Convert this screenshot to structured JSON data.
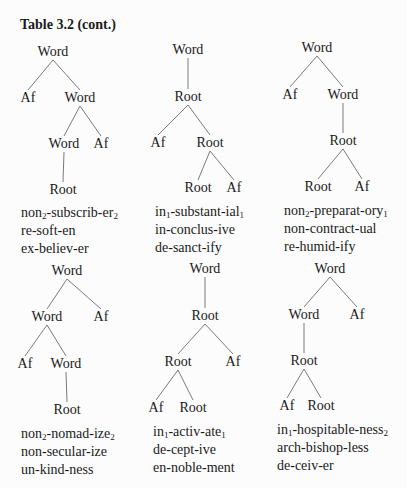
{
  "title": "Table 3.2 (cont.)",
  "trees": [
    {
      "nodes": [
        {
          "label": "Word",
          "x": 53,
          "y": 52
        },
        {
          "label": "Af",
          "x": 28,
          "y": 98
        },
        {
          "label": "Word",
          "x": 80,
          "y": 98
        },
        {
          "label": "Word",
          "x": 64,
          "y": 144
        },
        {
          "label": "Af",
          "x": 101,
          "y": 144
        },
        {
          "label": "Root",
          "x": 63,
          "y": 190
        }
      ],
      "edges": [
        [
          0,
          1
        ],
        [
          0,
          2
        ],
        [
          2,
          3
        ],
        [
          2,
          4
        ],
        [
          3,
          5
        ]
      ],
      "examples_pos": {
        "x": 21,
        "y": 204
      },
      "examples": [
        {
          "base": "non",
          "sub1": "2",
          "mid": "-subscrib-er",
          "sub2": "2"
        },
        {
          "base": "re-soft-en",
          "sub1": "",
          "mid": "",
          "sub2": ""
        },
        {
          "base": "ex-believ-er",
          "sub1": "",
          "mid": "",
          "sub2": ""
        }
      ]
    },
    {
      "nodes": [
        {
          "label": "Word",
          "x": 188,
          "y": 50
        },
        {
          "label": "Root",
          "x": 188,
          "y": 97
        },
        {
          "label": "Af",
          "x": 158,
          "y": 143
        },
        {
          "label": "Root",
          "x": 210,
          "y": 143
        },
        {
          "label": "Root",
          "x": 198,
          "y": 188
        },
        {
          "label": "Af",
          "x": 234,
          "y": 188
        }
      ],
      "edges": [
        [
          0,
          1
        ],
        [
          1,
          2
        ],
        [
          1,
          3
        ],
        [
          3,
          4
        ],
        [
          3,
          5
        ]
      ],
      "examples_pos": {
        "x": 155,
        "y": 203
      },
      "examples": [
        {
          "base": "in",
          "sub1": "1",
          "mid": "-substant-ial",
          "sub2": "1"
        },
        {
          "base": "in-conclus-ive",
          "sub1": "",
          "mid": "",
          "sub2": ""
        },
        {
          "base": "de-sanct-ify",
          "sub1": "",
          "mid": "",
          "sub2": ""
        }
      ]
    },
    {
      "nodes": [
        {
          "label": "Word",
          "x": 317,
          "y": 48
        },
        {
          "label": "Af",
          "x": 290,
          "y": 95
        },
        {
          "label": "Word",
          "x": 343,
          "y": 95
        },
        {
          "label": "Root",
          "x": 343,
          "y": 141
        },
        {
          "label": "Root",
          "x": 318,
          "y": 187
        },
        {
          "label": "Af",
          "x": 362,
          "y": 187
        }
      ],
      "edges": [
        [
          0,
          1
        ],
        [
          0,
          2
        ],
        [
          2,
          3
        ],
        [
          3,
          4
        ],
        [
          3,
          5
        ]
      ],
      "examples_pos": {
        "x": 284,
        "y": 202
      },
      "examples": [
        {
          "base": "non",
          "sub1": "2",
          "mid": "-preparat-ory",
          "sub2": "1"
        },
        {
          "base": "non-contract-ual",
          "sub1": "",
          "mid": "",
          "sub2": ""
        },
        {
          "base": "re-humid-ify",
          "sub1": "",
          "mid": "",
          "sub2": ""
        }
      ]
    },
    {
      "nodes": [
        {
          "label": "Word",
          "x": 67,
          "y": 271
        },
        {
          "label": "Word",
          "x": 47,
          "y": 317
        },
        {
          "label": "Af",
          "x": 101,
          "y": 317
        },
        {
          "label": "Af",
          "x": 25,
          "y": 364
        },
        {
          "label": "Word",
          "x": 66,
          "y": 364
        },
        {
          "label": "Root",
          "x": 67,
          "y": 410
        }
      ],
      "edges": [
        [
          0,
          1
        ],
        [
          0,
          2
        ],
        [
          1,
          3
        ],
        [
          1,
          4
        ],
        [
          4,
          5
        ]
      ],
      "examples_pos": {
        "x": 21,
        "y": 425
      },
      "examples": [
        {
          "base": "non",
          "sub1": "2",
          "mid": "-nomad-ize",
          "sub2": "2"
        },
        {
          "base": "non-secular-ize",
          "sub1": "",
          "mid": "",
          "sub2": ""
        },
        {
          "base": "un-kind-ness",
          "sub1": "",
          "mid": "",
          "sub2": ""
        }
      ]
    },
    {
      "nodes": [
        {
          "label": "Word",
          "x": 205,
          "y": 269
        },
        {
          "label": "Root",
          "x": 205,
          "y": 316
        },
        {
          "label": "Root",
          "x": 178,
          "y": 362
        },
        {
          "label": "Af",
          "x": 233,
          "y": 362
        },
        {
          "label": "Af",
          "x": 156,
          "y": 408
        },
        {
          "label": "Root",
          "x": 193,
          "y": 408
        }
      ],
      "edges": [
        [
          0,
          1
        ],
        [
          1,
          2
        ],
        [
          1,
          3
        ],
        [
          2,
          4
        ],
        [
          2,
          5
        ]
      ],
      "examples_pos": {
        "x": 153,
        "y": 423
      },
      "examples": [
        {
          "base": "in",
          "sub1": "1",
          "mid": "-activ-ate",
          "sub2": "1"
        },
        {
          "base": "de-cept-ive",
          "sub1": "",
          "mid": "",
          "sub2": ""
        },
        {
          "base": "en-noble-ment",
          "sub1": "",
          "mid": "",
          "sub2": ""
        }
      ]
    },
    {
      "nodes": [
        {
          "label": "Word",
          "x": 330,
          "y": 269
        },
        {
          "label": "Word",
          "x": 304,
          "y": 315
        },
        {
          "label": "Af",
          "x": 357,
          "y": 315
        },
        {
          "label": "Root",
          "x": 304,
          "y": 361
        },
        {
          "label": "Af",
          "x": 287,
          "y": 406
        },
        {
          "label": "Root",
          "x": 321,
          "y": 406
        }
      ],
      "edges": [
        [
          0,
          1
        ],
        [
          0,
          2
        ],
        [
          1,
          3
        ],
        [
          3,
          4
        ],
        [
          3,
          5
        ]
      ],
      "examples_pos": {
        "x": 277,
        "y": 421
      },
      "examples": [
        {
          "base": "in",
          "sub1": "1",
          "mid": "-hospitable-ness",
          "sub2": "2"
        },
        {
          "base": "arch-bishop-less",
          "sub1": "",
          "mid": "",
          "sub2": ""
        },
        {
          "base": "de-ceiv-er",
          "sub1": "",
          "mid": "",
          "sub2": ""
        }
      ]
    }
  ]
}
